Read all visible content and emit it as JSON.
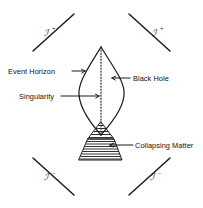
{
  "figure": {
    "type": "penrose-conformal-diagram",
    "background_color": "#ffffff",
    "ink_color": "#1a1a1a"
  },
  "labels": {
    "event_horizon": "Event Horizon",
    "singularity": "Singularity",
    "black_hole": "Black Hole",
    "collapsing_matter": "Collapsing Matter"
  },
  "null_infinity": {
    "glyph": "ℐ",
    "top_left": {
      "glyph": "ℐ",
      "sign": "+"
    },
    "top_right": {
      "glyph": "ℐ",
      "sign": "+"
    },
    "bottom_left": {
      "glyph": "ℐ",
      "sign": "−"
    },
    "bottom_right": {
      "glyph": "ℐ",
      "sign": "−"
    }
  },
  "regions": {
    "event_horizon_shape": "lens",
    "singularity_style": "dotted-vertical-line",
    "collapsing_matter_style": "horizontal-hatched-trapezoid"
  }
}
